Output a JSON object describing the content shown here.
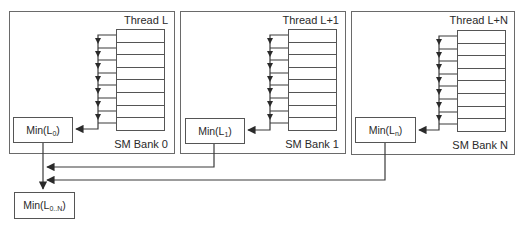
{
  "banks": [
    {
      "thread_label": "Thread L",
      "bank_label": "SM Bank 0",
      "min_prefix": "Min(L",
      "min_sub": "0",
      "min_suffix": ")",
      "register_rows": 8
    },
    {
      "thread_label": "Thread L+1",
      "bank_label": "SM Bank 1",
      "min_prefix": "Min(L",
      "min_sub": "1",
      "min_suffix": ")",
      "register_rows": 8
    },
    {
      "thread_label": "Thread L+N",
      "bank_label": "SM Bank N",
      "min_prefix": "Min(L",
      "min_sub": "n",
      "min_suffix": ")",
      "register_rows": 8
    }
  ],
  "final": {
    "min_prefix": "Min(L",
    "min_sub": "0..N",
    "min_suffix": ")"
  },
  "colors": {
    "line": "#3a3a3a",
    "border": "#6a6a6a"
  }
}
